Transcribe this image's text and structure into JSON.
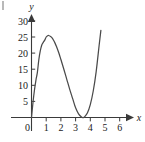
{
  "figure": {
    "title": "",
    "axis_x_label": "x",
    "axis_y_label": "y",
    "origin_label": "0",
    "corner_mark": ""
  },
  "chart_data": {
    "type": "line",
    "title": "",
    "subtitle": "",
    "xlabel": "x",
    "ylabel": "y",
    "grid": false,
    "legend": null,
    "legend_position": "none",
    "xlim": [
      -0.25,
      6.6
    ],
    "ylim": [
      -2.5,
      31.5
    ],
    "xticks": [
      0,
      1,
      2,
      3,
      4,
      5,
      6
    ],
    "xtick_labels": [
      "0",
      "1",
      "2",
      "3",
      "4",
      "5",
      "6"
    ],
    "yticks": [
      5,
      10,
      15,
      20,
      25,
      30
    ],
    "ytick_labels": [
      "5",
      "10",
      "15",
      "20",
      "25",
      "30"
    ],
    "curve_equation": "y = 4x(x - 3.5)^2",
    "roots": [
      0,
      3.5
    ],
    "local_maximum": {
      "x": 1.17,
      "y": 25.5
    },
    "local_minimum": {
      "x": 3.5,
      "y": 0
    },
    "x_domain_drawn": [
      0.0,
      4.72
    ],
    "series": [
      {
        "name": "cubic",
        "color": "#4a4a4a",
        "x": [
          0.0,
          0.1,
          0.2,
          0.3,
          0.4,
          0.5,
          0.6,
          0.7,
          0.8,
          0.9,
          1.0,
          1.1,
          1.17,
          1.3,
          1.4,
          1.5,
          1.6,
          1.7,
          1.8,
          1.9,
          2.0,
          2.2,
          2.4,
          2.6,
          2.8,
          3.0,
          3.2,
          3.4,
          3.5,
          3.6,
          3.8,
          4.0,
          4.2,
          4.4,
          4.6,
          4.72
        ],
        "y": [
          0.0,
          4.62,
          8.45,
          11.56,
          14.02,
          18.0,
          20.74,
          22.54,
          23.33,
          24.03,
          25.0,
          25.41,
          25.46,
          25.14,
          24.7,
          24.0,
          23.1,
          22.03,
          20.81,
          19.49,
          18.0,
          14.98,
          11.86,
          8.74,
          5.88,
          3.0,
          1.15,
          0.14,
          0.0,
          0.14,
          1.37,
          4.0,
          8.23,
          14.26,
          22.36,
          27.06
        ]
      }
    ]
  }
}
